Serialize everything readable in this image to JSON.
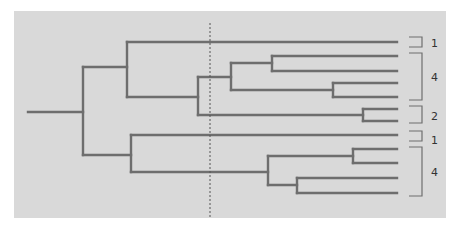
{
  "diagram": {
    "type": "dendrogram",
    "panel_color": "#d9d9d9",
    "line_color": "#6e6e6e",
    "bracket_color": "#6e6e6e",
    "dashed_line_color": "#555555",
    "cut_line": {
      "x": 210,
      "description": "dashed cut line"
    },
    "leaves_count": 12,
    "groups": [
      {
        "label": "1",
        "leaves": 1
      },
      {
        "label": "4",
        "leaves": 4
      },
      {
        "label": "2",
        "leaves": 2
      },
      {
        "label": "1",
        "leaves": 1
      },
      {
        "label": "4",
        "leaves": 4
      }
    ]
  }
}
